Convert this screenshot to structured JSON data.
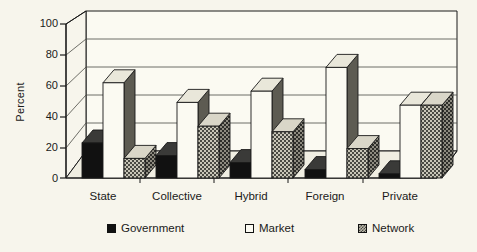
{
  "chart_data": {
    "type": "bar",
    "title": "",
    "subtitle": "",
    "xlabel": "",
    "ylabel": "Percent",
    "ylim": [
      0,
      100
    ],
    "yticks": [
      0,
      20,
      40,
      60,
      80,
      100
    ],
    "ytick_labels": [
      "0",
      "20",
      "40",
      "60",
      "80",
      "100"
    ],
    "categories": [
      "State",
      "Collective",
      "Hybrid",
      "Foreign",
      "Private"
    ],
    "series": [
      {
        "name": "Government",
        "values": [
          25,
          16,
          11,
          6,
          3
        ],
        "fill": "solid-black",
        "color": "#111111"
      },
      {
        "name": "Market",
        "values": [
          68,
          54,
          62,
          79,
          52
        ],
        "fill": "solid-white",
        "color": "#fbfaf2"
      },
      {
        "name": "Network",
        "values": [
          14,
          37,
          33,
          21,
          52
        ],
        "fill": "hatched",
        "color": "#b9b6a8"
      }
    ],
    "legend": {
      "position": "bottom",
      "entries": [
        "Government",
        "Market",
        "Network"
      ]
    },
    "grid": true,
    "style": "3d-clustered-column",
    "background_color": "#f7f5ec",
    "axis_color": "#1a1a1a"
  }
}
